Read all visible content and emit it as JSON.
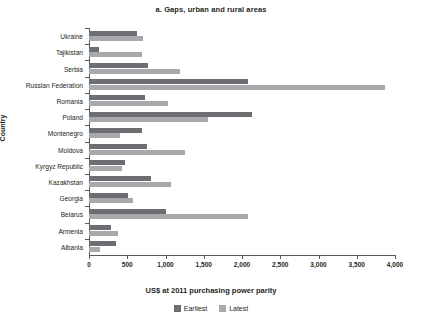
{
  "chart_data": {
    "type": "bar",
    "orientation": "horizontal",
    "title": "a. Gaps, urban and rural areas",
    "xlabel": "US$ at 2011 purchasing power parity",
    "ylabel": "Country",
    "xlim": [
      0,
      4000
    ],
    "xticks": [
      0,
      500,
      1000,
      1500,
      2000,
      2500,
      3000,
      3500,
      4000
    ],
    "xtick_labels": [
      "0",
      "500",
      "1,000",
      "1,500",
      "2,000",
      "2,500",
      "3,000",
      "3,500",
      "4,000"
    ],
    "grid": false,
    "legend_position": "bottom",
    "categories": [
      "Ukraine",
      "Tajikistan",
      "Serbia",
      "Russian Federation",
      "Romania",
      "Poland",
      "Montenegro",
      "Moldova",
      "Kyrgyz Republic",
      "Kazakhstan",
      "Georgia",
      "Belarus",
      "Armenia",
      "Albania"
    ],
    "series": [
      {
        "name": "Earliest",
        "color": "#6d6e71",
        "values": [
          630,
          130,
          770,
          2080,
          730,
          2130,
          690,
          760,
          470,
          810,
          510,
          1005,
          290,
          350
        ]
      },
      {
        "name": "Latest",
        "color": "#a7a9ac",
        "values": [
          705,
          690,
          1190,
          3870,
          1030,
          1555,
          405,
          1255,
          430,
          1070,
          575,
          2080,
          380,
          140
        ]
      }
    ]
  }
}
